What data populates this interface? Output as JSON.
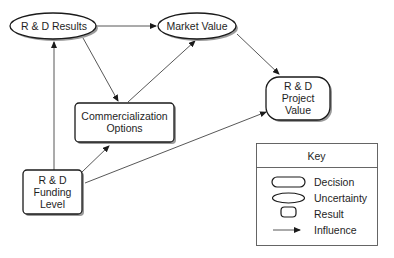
{
  "diagram": {
    "type": "influence-diagram",
    "nodes": {
      "rd_results": {
        "label": "R & D Results",
        "kind": "uncertainty"
      },
      "market_value": {
        "label": "Market Value",
        "kind": "uncertainty"
      },
      "commercialization": {
        "line1": "Commercialization",
        "line2": "Options",
        "kind": "decision"
      },
      "project_value": {
        "line1": "R & D",
        "line2": "Project",
        "line3": "Value",
        "kind": "result"
      },
      "funding_level": {
        "line1": "R & D",
        "line2": "Funding",
        "line3": "Level",
        "kind": "decision"
      }
    },
    "edges": [
      {
        "from": "R & D Results",
        "to": "Market Value"
      },
      {
        "from": "R & D Results",
        "to": "Commercialization Options"
      },
      {
        "from": "Commercialization Options",
        "to": "Market Value"
      },
      {
        "from": "Market Value",
        "to": "R & D Project Value"
      },
      {
        "from": "R & D Funding Level",
        "to": "R & D Results"
      },
      {
        "from": "R & D Funding Level",
        "to": "Commercialization Options"
      },
      {
        "from": "R & D Funding Level",
        "to": "R & D Project Value"
      }
    ]
  },
  "key": {
    "title": "Key",
    "items": [
      {
        "shape": "rounded-rectangle",
        "label": "Decision"
      },
      {
        "shape": "ellipse",
        "label": "Uncertainty"
      },
      {
        "shape": "small-rounded-square",
        "label": "Result"
      },
      {
        "shape": "arrow",
        "label": "Influence"
      }
    ]
  },
  "colors": {
    "stroke": "#1a1a1a",
    "line": "#444444",
    "shadow": "#9a9a9a",
    "background": "#ffffff"
  }
}
